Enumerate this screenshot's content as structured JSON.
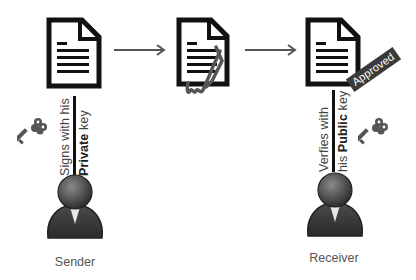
{
  "diagram": {
    "nodes": [
      {
        "id": "doc-original",
        "type": "document-icon"
      },
      {
        "id": "doc-signed",
        "type": "document-icon",
        "decoration": "signature-scribble"
      },
      {
        "id": "doc-approved",
        "type": "document-icon",
        "badge": "Approved"
      }
    ],
    "edges": [
      {
        "from": "doc-original",
        "to": "doc-signed",
        "style": "arrow"
      },
      {
        "from": "doc-signed",
        "to": "doc-approved",
        "style": "arrow"
      }
    ],
    "sender": {
      "label": "Sender",
      "action_line1": "Signs with his",
      "action_line2_bold": "Private",
      "action_line2_rest": " key",
      "icon": "key-icon"
    },
    "receiver": {
      "label": "Receiver",
      "action_line1": "Verfies with",
      "action_line2_prefix": "his ",
      "action_line2_bold": "Public",
      "action_line2_rest": " key",
      "icon": "key-icon"
    },
    "badge_text": "Approved",
    "colors": {
      "icon_stroke": "#111111",
      "arrow": "#555555",
      "badge_bg": "#3a3a3a",
      "person": "#3c3c3c",
      "key": "#555555"
    }
  }
}
